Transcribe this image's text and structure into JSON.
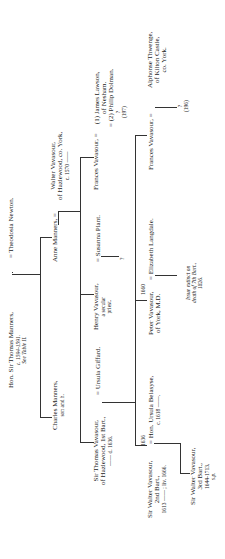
{
  "document": {
    "type": "genealogical-table",
    "orientation": "rotated-90-ccw"
  },
  "people": {
    "thomas_manners": {
      "name": "Hon. Sir Thomas Manners,",
      "dates": "c. 1594-1591.",
      "note": "See Table II."
    },
    "theodosia": {
      "name": "= Theodosia Newton."
    },
    "charles": {
      "name": "Charles Manners,",
      "note": "son and h."
    },
    "anne": {
      "name": "Anne Manners, ="
    },
    "walter_sr": {
      "name": "Walter Vavasour,",
      "line2": "of Hazlewood, co. York,",
      "dates": "c. 1570 ——"
    },
    "thomas_v": {
      "name": "Sir Thomas Vavasour,",
      "line2": "of Hazlewood, 1st Bart.,",
      "dates": "—— d. 1636."
    },
    "ursula_g": {
      "name": "= Ursula Giffard."
    },
    "henry": {
      "name": "Henry Vavasour,",
      "line2": "a secular",
      "line3": "priest."
    },
    "susanna": {
      "name": "= Susanna Plant."
    },
    "henry_issue": {
      "mark": "?"
    },
    "frances1": {
      "name": "Frances Vavasour, ="
    },
    "lawson": {
      "name": "(1) James Lawson,",
      "line2": "of Nesham."
    },
    "dolman": {
      "name": "= (2) Philip Dolman."
    },
    "frances1_issue": {
      "mark": "?",
      "ref": "(197)"
    },
    "walter_2": {
      "name": "Sir Walter Vavasour,",
      "line2": "2nd Bart.,",
      "dates": "1613 —— ; liv. 1666."
    },
    "marriage_year": {
      "text": "1636"
    },
    "ursula_b": {
      "name": "= Hon. Ursula Belasyse,",
      "dates": "c. 1618 ——."
    },
    "peter": {
      "name": "Peter Vavasour,",
      "line2": "of York, M.D."
    },
    "peter_year": {
      "text": "1660"
    },
    "elizabeth": {
      "name": "= Elizabeth Langdale."
    },
    "issue_note": {
      "line1": "Issue extinct on",
      "line2": "death of 7th Bart.,",
      "line3": "1826."
    },
    "frances2": {
      "name": "Frances Vavasour, ="
    },
    "thwenge": {
      "name": "Alphonse Thwenge,",
      "line2": "of Kilton Castle,",
      "line3": "co. York."
    },
    "frances2_issue": {
      "mark": "?",
      "ref": "(196)"
    },
    "walter_3": {
      "name": "Sir Walter Vavasour,",
      "line2": "3rd Bart.,",
      "dates": "1644-1713,",
      "note": "s.p."
    }
  }
}
